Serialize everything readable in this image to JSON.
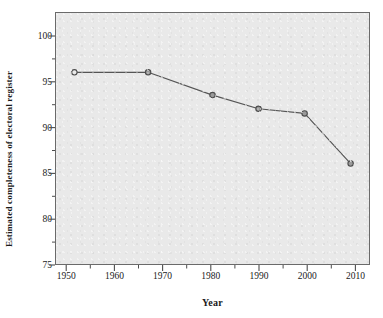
{
  "chart_data": {
    "type": "line",
    "title": "",
    "xlabel": "Year",
    "ylabel": "Estimated completeness of electoral register",
    "xlim": [
      1946,
      2014
    ],
    "ylim": [
      75,
      102.5
    ],
    "grid": false,
    "legend": "none",
    "marker": "open-circle",
    "line_color": "#555555",
    "plot_background": "#e9e9e9",
    "frame_color": "#6a6a6a",
    "x": [
      1950,
      1966,
      1980,
      1990,
      2000,
      2010
    ],
    "values": [
      96.0,
      96.0,
      93.5,
      92.0,
      91.5,
      86.0
    ],
    "series": [
      {
        "name": "Estimated completeness of electoral register",
        "points": [
          {
            "x": 1950,
            "y": 96.0
          },
          {
            "x": 1966,
            "y": 96.0
          },
          {
            "x": 1980,
            "y": 93.5
          },
          {
            "x": 1990,
            "y": 92.0
          },
          {
            "x": 2000,
            "y": 91.5
          },
          {
            "x": 2010,
            "y": 86.0
          }
        ]
      }
    ],
    "x_ticks": [
      1950,
      1960,
      1970,
      1980,
      1990,
      2000,
      2010
    ],
    "x_tick_labels": [
      "1950",
      "1960",
      "1970",
      "1980",
      "1990",
      "2000",
      "2010"
    ],
    "y_ticks": [
      75,
      80,
      85,
      90,
      95,
      100
    ],
    "y_tick_labels": [
      "75",
      "80",
      "85",
      "90",
      "95",
      "100"
    ],
    "y_minor_ticks": [
      77.5,
      82.5,
      87.5,
      92.5,
      97.5
    ],
    "x_minor_ticks": [
      1955,
      1965,
      1975,
      1985,
      1995,
      2005
    ]
  },
  "axes": {
    "y_labels": [
      "100",
      "95",
      "90",
      "85",
      "80",
      "75"
    ],
    "x_labels": [
      "1950",
      "1960",
      "1970",
      "1980",
      "1990",
      "2000",
      "2010"
    ],
    "y_title": "Estimated completeness of electoral register",
    "x_title": "Year"
  }
}
